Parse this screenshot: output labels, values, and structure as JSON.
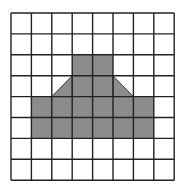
{
  "diagram": {
    "type": "grid-shape",
    "rows": 8,
    "cols": 8,
    "origin": {
      "x": 11,
      "y": 13
    },
    "cell_w": 20.4,
    "cell_h": 20.9,
    "colors": {
      "fill": "#8c8c8c",
      "line": "#222222",
      "background": "#ffffff"
    },
    "filled_cells": [
      [
        2,
        3
      ],
      [
        2,
        4
      ],
      [
        3,
        3
      ],
      [
        3,
        4
      ],
      [
        4,
        1
      ],
      [
        4,
        2
      ],
      [
        4,
        3
      ],
      [
        4,
        4
      ],
      [
        4,
        5
      ],
      [
        4,
        6
      ],
      [
        5,
        1
      ],
      [
        5,
        2
      ],
      [
        5,
        3
      ],
      [
        5,
        4
      ],
      [
        5,
        5
      ],
      [
        5,
        6
      ]
    ],
    "half_triangles": [
      {
        "row": 3,
        "col": 2,
        "points": [
          "tr",
          "br",
          "bl"
        ]
      },
      {
        "row": 3,
        "col": 5,
        "points": [
          "tl",
          "br",
          "bl"
        ]
      }
    ]
  }
}
